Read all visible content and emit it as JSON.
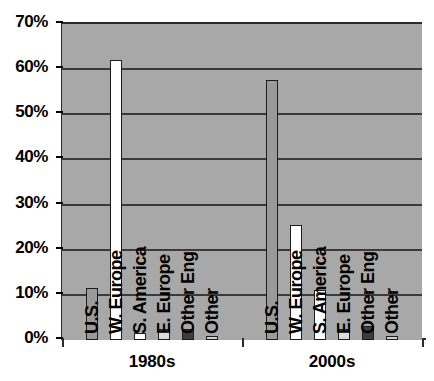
{
  "chart_data": {
    "type": "bar",
    "title": "",
    "subtitle": "",
    "xlabel": "",
    "ylabel": "",
    "categories": [
      "1980s",
      "2000s"
    ],
    "ylim": [
      0,
      70
    ],
    "ytick_labels": [
      "0%",
      "10%",
      "20%",
      "30%",
      "40%",
      "50%",
      "60%",
      "70%"
    ],
    "ytick_values": [
      0,
      10,
      20,
      30,
      40,
      50,
      60,
      70
    ],
    "grid": true,
    "legend": "none",
    "series": [
      {
        "name": "U.S.",
        "values": [
          11.5,
          57.5
        ],
        "color": "#9a9a9a"
      },
      {
        "name": "W. Europe",
        "values": [
          62,
          25.5
        ],
        "color": "#ffffff"
      },
      {
        "name": "S. America",
        "values": [
          1.5,
          11
        ],
        "color": "#ffffff"
      },
      {
        "name": "E. Europe",
        "values": [
          2.5,
          2.5
        ],
        "color": "#dcdcdc"
      },
      {
        "name": "Other Eng",
        "values": [
          2.5,
          3
        ],
        "color": "#3c3c3c"
      },
      {
        "name": "Other",
        "values": [
          1,
          1
        ],
        "color": "#d0d0d0"
      }
    ],
    "plot_background": "#a8a8a8",
    "axis_color": "#2a2a2a",
    "bar_border_color": "#1c1c1c"
  }
}
